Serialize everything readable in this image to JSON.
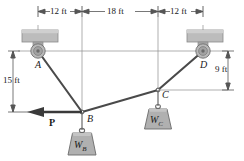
{
  "figure": {
    "colors": {
      "line": "#3a3a3a",
      "member": "#4a4a4a",
      "dimension": "#555555",
      "support_fill": "#b4b4b4",
      "support_edge": "#8a8a8a",
      "pulley_fill": "#b8b8b8",
      "pulley_edge": "#6e6e6e",
      "weight_fill": "#b0b0b0",
      "weight_edge": "#6a6a6a",
      "text": "#1a1a1a"
    }
  },
  "dimensions": {
    "horizontal": [
      {
        "id": "dim-a-b",
        "label": "12 ft"
      },
      {
        "id": "dim-b-c",
        "label": "18 ft"
      },
      {
        "id": "dim-c-d",
        "label": "12 ft"
      }
    ],
    "vertical": [
      {
        "id": "dim-left",
        "label": "15 ft"
      },
      {
        "id": "dim-right",
        "label": "9 ft"
      }
    ]
  },
  "points": [
    {
      "id": "point-a",
      "label": "A",
      "type": "pulley"
    },
    {
      "id": "point-b",
      "label": "B",
      "type": "joint"
    },
    {
      "id": "point-c",
      "label": "C",
      "type": "joint"
    },
    {
      "id": "point-d",
      "label": "D",
      "type": "pulley"
    }
  ],
  "loads": {
    "applied_force": {
      "id": "force-p",
      "label": "P",
      "direction": "left"
    },
    "weights": [
      {
        "id": "weight-b",
        "symbol": "W",
        "subscript": "B"
      },
      {
        "id": "weight-c",
        "symbol": "W",
        "subscript": "C"
      }
    ]
  }
}
